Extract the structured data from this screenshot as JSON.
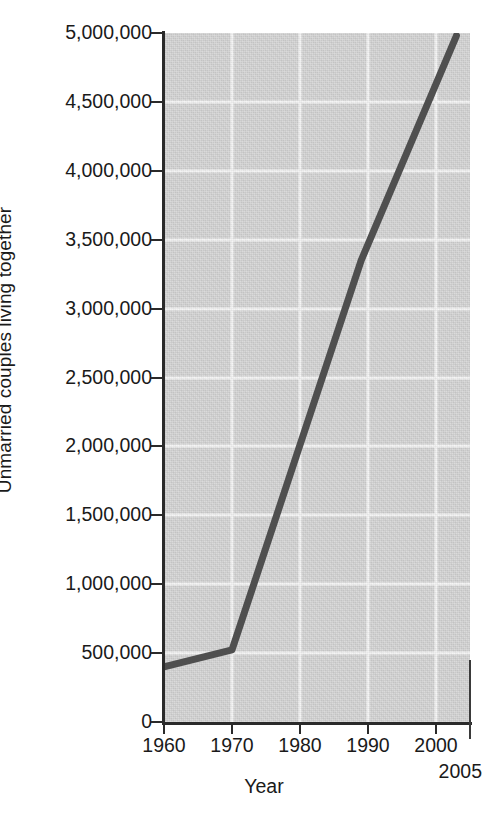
{
  "chart_data": {
    "type": "line",
    "title": "",
    "xlabel": "Year",
    "ylabel": "Unmarried couples living together",
    "xlim": [
      1960,
      2005
    ],
    "ylim": [
      0,
      5000000
    ],
    "grid": true,
    "legend": "none",
    "x_ticks": [
      1960,
      1970,
      1980,
      1990,
      2000
    ],
    "x_tick_labels": [
      "1960",
      "1970",
      "1980",
      "1990",
      "2000"
    ],
    "x_extra_tick": 2005,
    "x_extra_tick_label": "2005",
    "y_ticks": [
      0,
      500000,
      1000000,
      1500000,
      2000000,
      2500000,
      3000000,
      3500000,
      4000000,
      4500000,
      5000000
    ],
    "y_tick_labels": [
      "0",
      "500,000",
      "1,000,000",
      "1,500,000",
      "2,000,000",
      "2,500,000",
      "3,000,000",
      "3,500,000",
      "4,000,000",
      "4,500,000",
      "5,000,000"
    ],
    "series": [
      {
        "name": "Unmarried couples living together",
        "color": "#4f4f4f",
        "x": [
          1960,
          1970,
          1989,
          2003
        ],
        "values": [
          400000,
          523000,
          3350000,
          4980000
        ]
      }
    ],
    "plot_background": "#d2d2d2",
    "gridline_color": "#f4f4f4",
    "axis_color": "#2a2a2a",
    "line_color": "#4f4f4f"
  }
}
